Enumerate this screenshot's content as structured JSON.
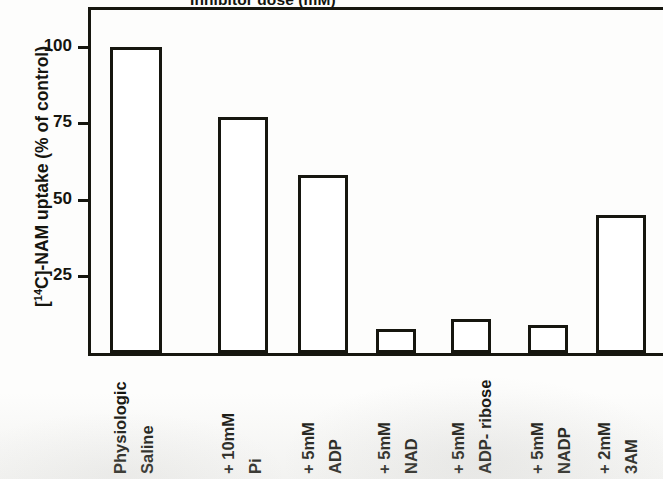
{
  "chart_data": {
    "type": "bar",
    "title": "Inhibitor dose (mM)",
    "title_clipped": true,
    "xlabel": "",
    "ylabel": "[14C]-NAM uptake (% of control)",
    "ylabel_parts": {
      "bracket_open": "[",
      "superscript": "14",
      "element": "C]-NAM uptake (% of control)"
    },
    "ylim": [
      0,
      112
    ],
    "yticks": [
      25,
      50,
      75,
      100
    ],
    "ytick_labels": [
      "25",
      "50",
      "75",
      "100"
    ],
    "grid": false,
    "legend": "none",
    "bar_style": "hollow-outline",
    "categories": [
      "Physiologic Saline",
      "+10mM Pi",
      "+5mM ADP",
      "+5mM NAD",
      "+5mM ADP- ribose",
      "+5mM NADP",
      "+2mM 3AM"
    ],
    "category_lines": [
      [
        "Physiologic",
        "Saline"
      ],
      [
        "+ 10mM",
        "Pi"
      ],
      [
        "+ 5mM",
        "ADP"
      ],
      [
        "+ 5mM",
        "NAD"
      ],
      [
        "+ 5mM",
        "ADP- ribose"
      ],
      [
        "+ 5mM",
        "NADP"
      ],
      [
        "+ 2mM",
        "3AM"
      ]
    ],
    "values": [
      100,
      77,
      58,
      8,
      11,
      9,
      45
    ],
    "series": [
      {
        "name": "[14C]-NAM uptake",
        "values": [
          100,
          77,
          58,
          8,
          11,
          9,
          45
        ]
      }
    ]
  },
  "bar_geometry": [
    {
      "left": 19,
      "width": 52
    },
    {
      "left": 127,
      "width": 50
    },
    {
      "left": 207,
      "width": 50
    },
    {
      "left": 285,
      "width": 40
    },
    {
      "left": 360,
      "width": 40
    },
    {
      "left": 437,
      "width": 40
    },
    {
      "left": 505,
      "width": 50
    }
  ],
  "label_geometry": [
    {
      "left": 20,
      "lines_x": [
        0,
        27
      ]
    },
    {
      "left": 128,
      "lines_x": [
        0,
        27
      ]
    },
    {
      "left": 208,
      "lines_x": [
        0,
        27
      ]
    },
    {
      "left": 284,
      "lines_x": [
        0,
        27
      ]
    },
    {
      "left": 358,
      "lines_x": [
        0,
        27
      ]
    },
    {
      "left": 437,
      "lines_x": [
        0,
        27
      ]
    },
    {
      "left": 504,
      "lines_x": [
        0,
        27
      ]
    }
  ],
  "colors": {
    "ink": "#16160f",
    "paper": "#fdfdfc",
    "bar_fill": "#ffffff"
  }
}
